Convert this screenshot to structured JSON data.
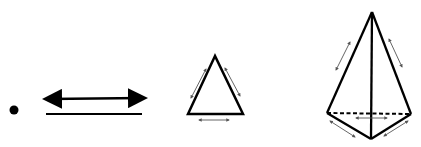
{
  "diagram": {
    "stroke_color": "#000000",
    "arrow_color": "#555555",
    "figures": [
      {
        "name": "point",
        "dimension": 0
      },
      {
        "name": "line",
        "dimension": 1
      },
      {
        "name": "triangle",
        "dimension": 2
      },
      {
        "name": "tetrahedron",
        "dimension": 3
      }
    ]
  }
}
